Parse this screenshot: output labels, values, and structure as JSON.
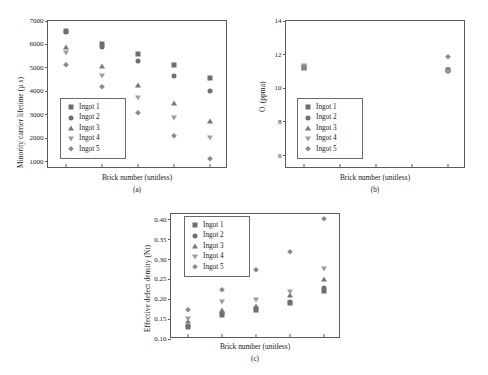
{
  "figure": {
    "series_names": [
      "Ingot 1",
      "Ingot 2",
      "Ingot 3",
      "Ingot 4",
      "Ingot 5"
    ],
    "marker_shapes": [
      "square",
      "circle",
      "triangle-up",
      "triangle-down",
      "diamond"
    ],
    "series_colors": [
      "#6e6e72",
      "#6e6e72",
      "#79797d",
      "#9d9da1",
      "#8a8a8e"
    ]
  },
  "chart_data": [
    {
      "type": "scatter",
      "panel": "(a)",
      "title": "",
      "xlabel": "Brick number (unitless)",
      "ylabel": "Minority carrier lifetime (µ s)",
      "x": [
        1,
        2,
        3,
        4,
        5
      ],
      "xlim": [
        0.5,
        5.5
      ],
      "xticklabels": [
        "",
        "",
        "",
        "",
        ""
      ],
      "ylim": [
        700,
        7000
      ],
      "yticks": [
        1000,
        2000,
        3000,
        4000,
        5000,
        6000,
        7000
      ],
      "grid": false,
      "legend_position": "lower-left",
      "series": [
        {
          "name": "Ingot 1",
          "marker": "square",
          "values": [
            6580,
            6000,
            5580,
            5110,
            4560
          ]
        },
        {
          "name": "Ingot 2",
          "marker": "circle",
          "values": [
            6530,
            5900,
            5300,
            4640,
            4040
          ]
        },
        {
          "name": "Ingot 3",
          "marker": "triangle-up",
          "values": [
            5880,
            5080,
            4290,
            3520,
            2740
          ]
        },
        {
          "name": "Ingot 4",
          "marker": "triangle-down",
          "values": [
            5620,
            4640,
            3720,
            2880,
            2030
          ]
        },
        {
          "name": "Ingot 5",
          "marker": "diamond",
          "values": [
            5120,
            4210,
            3100,
            2090,
            1110
          ]
        }
      ]
    },
    {
      "type": "scatter",
      "panel": "(b)",
      "title": "",
      "xlabel": "Brick number (unitless)",
      "ylabel": "Oᵢ (ppma)",
      "x": [
        1,
        2,
        3,
        4,
        5
      ],
      "xlim": [
        0.5,
        5.5
      ],
      "xticklabels": [
        "",
        "",
        "",
        "",
        ""
      ],
      "ylim": [
        5.2,
        14
      ],
      "yticks": [
        6,
        8,
        10,
        12,
        14
      ],
      "grid": false,
      "legend_position": "lower-left",
      "series": [
        {
          "name": "Ingot 1",
          "marker": "square",
          "values": [
            11.27,
            null,
            null,
            null,
            11.08
          ]
        },
        {
          "name": "Ingot 2",
          "marker": "circle",
          "values": [
            11.24,
            null,
            null,
            null,
            11.02
          ]
        },
        {
          "name": "Ingot 3",
          "marker": "triangle-up",
          "values": [
            11.22,
            null,
            null,
            null,
            11.14
          ]
        },
        {
          "name": "Ingot 4",
          "marker": "triangle-down",
          "values": [
            11.3,
            null,
            null,
            null,
            10.95
          ]
        },
        {
          "name": "Ingot 5",
          "marker": "diamond",
          "values": [
            11.26,
            null,
            null,
            null,
            11.88
          ]
        }
      ]
    },
    {
      "type": "scatter",
      "panel": "(c)",
      "title": "",
      "xlabel": "Brick number (unitless)",
      "ylabel": "Effective defect density (Nt)",
      "x": [
        1,
        2,
        3,
        4,
        5
      ],
      "xlim": [
        0.5,
        5.5
      ],
      "xticklabels": [
        "",
        "",
        "",
        "",
        ""
      ],
      "ylim": [
        0.1,
        0.415
      ],
      "yticks": [
        0.1,
        0.15,
        0.2,
        0.25,
        0.3,
        0.35,
        0.4
      ],
      "yticklabels": [
        "0.10",
        "0.15",
        "0.20",
        "0.25",
        "0.30",
        "0.35",
        "0.40"
      ],
      "grid": false,
      "legend_position": "upper-left",
      "series": [
        {
          "name": "Ingot 1",
          "marker": "square",
          "values": [
            0.13,
            0.16,
            0.173,
            0.19,
            0.222
          ]
        },
        {
          "name": "Ingot 2",
          "marker": "circle",
          "values": [
            0.133,
            0.165,
            0.178,
            0.192,
            0.228
          ]
        },
        {
          "name": "Ingot 3",
          "marker": "triangle-up",
          "values": [
            0.146,
            0.173,
            0.182,
            0.212,
            0.25
          ]
        },
        {
          "name": "Ingot 4",
          "marker": "triangle-down",
          "values": [
            0.15,
            0.192,
            0.199,
            0.219,
            0.276
          ]
        },
        {
          "name": "Ingot 5",
          "marker": "diamond",
          "values": [
            0.173,
            0.223,
            0.274,
            0.319,
            0.402
          ]
        }
      ]
    }
  ]
}
